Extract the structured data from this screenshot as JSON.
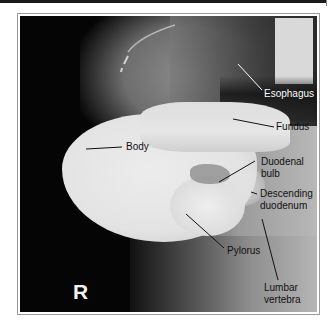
{
  "figure": {
    "side_marker": "R",
    "labels": {
      "esophagus": "Esophagus",
      "fundus": "Fundus",
      "body": "Body",
      "duodenal_bulb_line1": "Duodenal",
      "duodenal_bulb_line2": "bulb",
      "descending_duodenum_line1": "Descending",
      "descending_duodenum_line2": "duodenum",
      "pylorus": "Pylorus",
      "lumbar_vertebra_line1": "Lumbar",
      "lumbar_vertebra_line2": "vertebra"
    },
    "colors": {
      "background": "#050505",
      "barium": "#e6e6e6",
      "soft_tissue": "#8a8a8a",
      "label_light": "#ffffff",
      "label_dark": "#111111",
      "frame_border": "#9a9a9a"
    }
  }
}
